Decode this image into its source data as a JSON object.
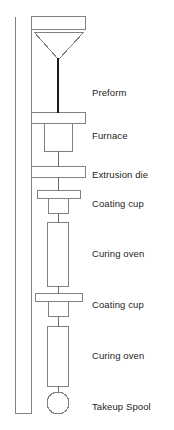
{
  "figure": {
    "width": 174,
    "height": 430,
    "background_color": "#ffffff",
    "outline_color": "#808080",
    "fiber_color": "#1a1a1a",
    "text_color": "#242424"
  },
  "labels": [
    {
      "id": "preform",
      "text": "Preform",
      "x": 92,
      "y": 87
    },
    {
      "id": "furnace",
      "text": "Furnace",
      "x": 92,
      "y": 130
    },
    {
      "id": "extrusion-die",
      "text": "Extrusion die",
      "x": 92,
      "y": 169
    },
    {
      "id": "coating-cup-1",
      "text": "Coating cup",
      "x": 92,
      "y": 198
    },
    {
      "id": "curing-oven-1",
      "text": "Curing oven",
      "x": 92,
      "y": 248
    },
    {
      "id": "coating-cup-2",
      "text": "Coating cup",
      "x": 92,
      "y": 299
    },
    {
      "id": "curing-oven-2",
      "text": "Curing oven",
      "x": 92,
      "y": 350
    },
    {
      "id": "takeup-spool",
      "text": "Takeup Spool",
      "x": 92,
      "y": 401
    }
  ],
  "components": {
    "tower_frame": {
      "x": 15,
      "y": 16,
      "width": 17,
      "height": 398
    },
    "top_plate": {
      "x": 31,
      "y": 16,
      "width": 55,
      "height": 14
    },
    "preform_cone": {
      "top_y": 32,
      "left_x": 34,
      "right_x": 83,
      "apex_x": 58,
      "apex_y": 60
    },
    "fiber_line": {
      "x": 58,
      "y_start": 58,
      "y_end": 112
    },
    "furnace_plate": {
      "x": 31,
      "y": 112,
      "width": 55,
      "height": 12
    },
    "furnace_body": {
      "x": 44,
      "y": 124,
      "width": 29,
      "height": 28
    },
    "die_plate": {
      "x": 31,
      "y": 166,
      "width": 55,
      "height": 12
    },
    "cup1_plate": {
      "x": 37,
      "y": 190,
      "width": 44,
      "height": 9
    },
    "cup1_body": {
      "x": 48,
      "y": 199,
      "width": 21,
      "height": 15
    },
    "oven1_tube": {
      "x": 47,
      "y": 222,
      "width": 22,
      "height": 65
    },
    "cup2_plate": {
      "x": 35,
      "y": 293,
      "width": 48,
      "height": 9
    },
    "cup2_body": {
      "x": 48,
      "y": 302,
      "width": 21,
      "height": 15
    },
    "oven2_tube": {
      "x": 47,
      "y": 326,
      "width": 22,
      "height": 61
    },
    "takeup_spool": {
      "cx": 58,
      "cy": 403,
      "r": 11
    }
  },
  "process_flow": [
    "Preform",
    "Furnace",
    "Extrusion die",
    "Coating cup",
    "Curing oven",
    "Coating cup",
    "Curing oven",
    "Takeup Spool"
  ]
}
